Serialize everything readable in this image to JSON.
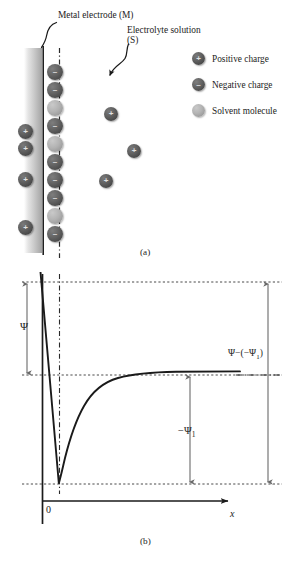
{
  "figure": {
    "panel_a": {
      "caption": "(a)",
      "annotations": [
        {
          "name": "metal-electrode",
          "text": "Metal electrode (M)"
        },
        {
          "name": "electrolyte-solution",
          "line1": "Electrolyte solution",
          "line2": "(S)"
        }
      ],
      "legend": [
        {
          "icon": "positive-charge-sphere",
          "glyph": "+",
          "label": "Positive charge",
          "color": "#5a5a5a"
        },
        {
          "icon": "negative-charge-sphere",
          "glyph": "–",
          "label": "Negative charge",
          "color": "#5e5e5e"
        },
        {
          "icon": "solvent-molecule-sphere",
          "glyph": "",
          "label": "Solvent molecule",
          "color": "#b0b0b0"
        }
      ],
      "electrode_color": "#1a1a1a",
      "inner_helmholtz_plane_style": "dash-dot",
      "metal_side_charges": [
        {
          "type": "positive",
          "glyph": "+",
          "x": 18,
          "y": 124
        },
        {
          "type": "positive",
          "glyph": "+",
          "x": 18,
          "y": 141
        },
        {
          "type": "positive",
          "glyph": "+",
          "x": 18,
          "y": 172
        },
        {
          "type": "positive",
          "glyph": "+",
          "x": 18,
          "y": 220
        }
      ],
      "solution_layer_column": [
        {
          "type": "negative",
          "glyph": "–",
          "x": 47,
          "y": 64
        },
        {
          "type": "negative",
          "glyph": "–",
          "x": 47,
          "y": 82
        },
        {
          "type": "solvent",
          "glyph": "",
          "x": 47,
          "y": 100
        },
        {
          "type": "negative",
          "glyph": "–",
          "x": 47,
          "y": 118
        },
        {
          "type": "solvent",
          "glyph": "",
          "x": 47,
          "y": 136
        },
        {
          "type": "negative",
          "glyph": "–",
          "x": 47,
          "y": 154
        },
        {
          "type": "negative",
          "glyph": "–",
          "x": 47,
          "y": 172
        },
        {
          "type": "negative",
          "glyph": "–",
          "x": 47,
          "y": 190
        },
        {
          "type": "solvent",
          "glyph": "",
          "x": 47,
          "y": 208
        },
        {
          "type": "negative",
          "glyph": "–",
          "x": 47,
          "y": 226
        }
      ],
      "bulk_charges": [
        {
          "type": "positive",
          "glyph": "+",
          "x": 104,
          "y": 107
        },
        {
          "type": "positive",
          "glyph": "+",
          "x": 127,
          "y": 144
        },
        {
          "type": "positive",
          "glyph": "+",
          "x": 99,
          "y": 174
        }
      ]
    },
    "panel_b": {
      "caption": "(b)",
      "x_axis_label": "x",
      "origin_label": "0",
      "potential_drop_label": "Ψ",
      "inner_potential_label": "−Ψ",
      "inner_potential_sub": "1",
      "total_label_prefix": "Ψ−(−Ψ",
      "total_label_sub": "1",
      "total_label_suffix": ")",
      "axis_color": "#1a1a1a",
      "curve_color": "#1a1a1a",
      "guide_line_color": "#555555"
    }
  },
  "chart_data": {
    "type": "line",
    "title": "",
    "xlabel": "x",
    "ylabel": "Ψ",
    "grid": false,
    "legend_position": "right",
    "annotations": [
      {
        "text": "Ψ",
        "meaning": "potential drop from metal surface to outer Helmholtz plane"
      },
      {
        "text": "−Ψ1",
        "meaning": "potential at outer Helmholtz plane relative to bulk"
      },
      {
        "text": "Ψ−(−Ψ1)",
        "meaning": "total potential difference metal to bulk solution"
      }
    ],
    "levels": {
      "metal_potential": 1.0,
      "bulk_potential": 0.0,
      "ohp_potential": -0.78
    },
    "x": [
      -0.12,
      -0.06,
      0.0,
      0.05,
      0.12,
      0.22,
      0.35,
      0.5,
      0.7,
      0.95,
      1.3,
      1.7,
      2.2,
      2.8,
      3.6
    ],
    "y": [
      1.0,
      0.1,
      -0.78,
      -0.62,
      -0.44,
      -0.3,
      -0.2,
      -0.13,
      -0.08,
      -0.045,
      -0.022,
      -0.01,
      -0.004,
      -0.001,
      0.0
    ],
    "xlim": [
      -0.2,
      4.0
    ],
    "ylim": [
      -1.0,
      1.1
    ]
  }
}
